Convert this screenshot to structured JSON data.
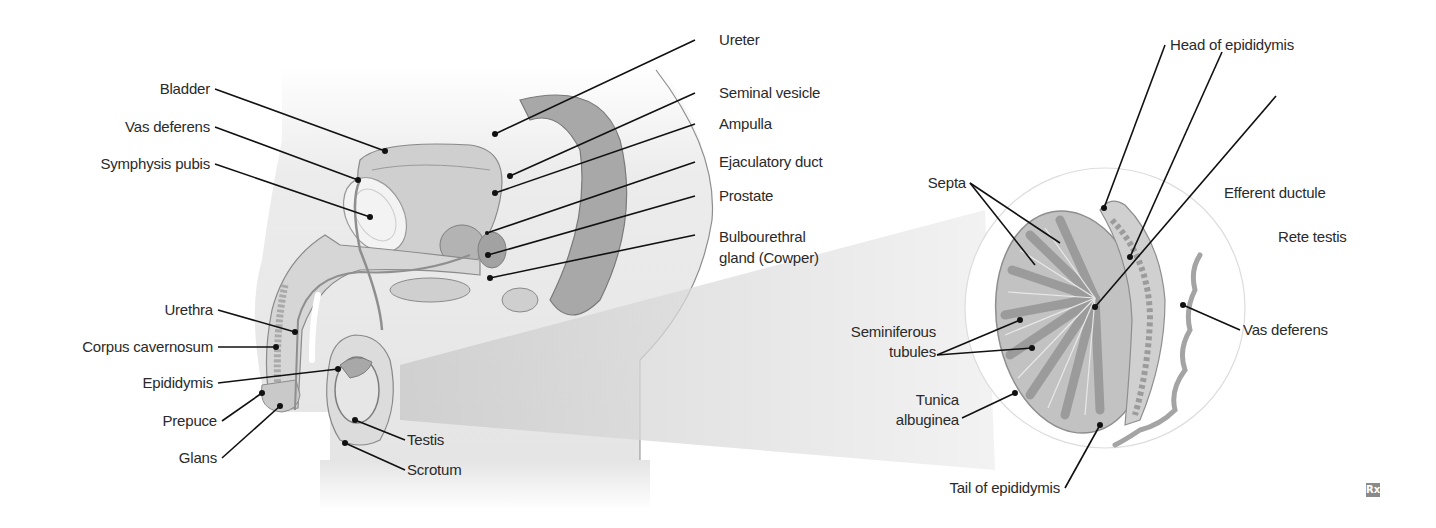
{
  "diagram": {
    "colors": {
      "tissue_light": "#e6e6e6",
      "tissue_mid": "#c4c4c4",
      "tissue_dark": "#9a9a9a",
      "outline": "#7d7d7d",
      "leader_line": "#111111",
      "label_text": "#2a2a2a"
    },
    "sagittal_view": {
      "left_labels": [
        {
          "text": "Bladder"
        },
        {
          "text": "Vas deferens"
        },
        {
          "text": "Symphysis pubis"
        },
        {
          "text": "Urethra"
        },
        {
          "text": "Corpus cavernosum"
        },
        {
          "text": "Epididymis"
        },
        {
          "text": "Prepuce"
        },
        {
          "text": "Glans"
        }
      ],
      "right_labels": [
        {
          "text": "Ureter"
        },
        {
          "text": "Seminal vesicle"
        },
        {
          "text": "Ampulla"
        },
        {
          "text": "Ejaculatory duct"
        },
        {
          "text": "Prostate"
        },
        {
          "text": "Bulbourethral\ngland (Cowper)"
        }
      ],
      "bottom_labels": [
        {
          "text": "Testis"
        },
        {
          "text": "Scrotum"
        }
      ]
    },
    "testis_detail": {
      "labels": [
        {
          "text": "Head of epididymis"
        },
        {
          "text": "Efferent ductule"
        },
        {
          "text": "Rete testis"
        },
        {
          "text": "Septa"
        },
        {
          "text": "Seminiferous\ntubules"
        },
        {
          "text": "Tunica\nalbuginea"
        },
        {
          "text": "Vas deferens"
        },
        {
          "text": "Tail of epididymis"
        }
      ]
    },
    "badge": {
      "icon": "rx-icon",
      "text": "Rx"
    }
  }
}
